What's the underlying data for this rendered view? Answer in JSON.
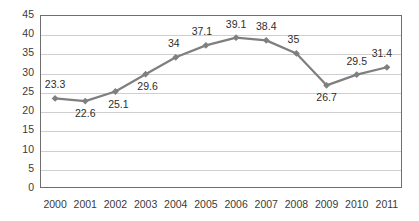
{
  "chart_data": {
    "type": "line",
    "title": "",
    "subtitle": "",
    "xlabel": "",
    "ylabel": "",
    "categories": [
      "2000",
      "2001",
      "2002",
      "2003",
      "2004",
      "2005",
      "2006",
      "2007",
      "2008",
      "2009",
      "2010",
      "2011"
    ],
    "values": [
      23.3,
      22.6,
      25.1,
      29.6,
      34,
      37.1,
      39.1,
      38.4,
      35,
      26.7,
      29.5,
      31.4
    ],
    "point_labels": [
      "23.3",
      "22.6",
      "25.1",
      "29.6",
      "34",
      "37.1",
      "39.1",
      "38.4",
      "35",
      "26.7",
      "29.5",
      "31.4"
    ],
    "label_positions": [
      "above",
      "below",
      "below",
      "below",
      "above",
      "above",
      "above",
      "above",
      "above",
      "below",
      "above",
      "above"
    ],
    "ylim": [
      0,
      45
    ],
    "ytick_step": 5,
    "yticks": [
      "0",
      "5",
      "10",
      "15",
      "20",
      "25",
      "30",
      "35",
      "40",
      "45"
    ],
    "grid": true,
    "legend": false,
    "legend_position": "none",
    "series": [
      {
        "name": "series-1",
        "color": "#7f7f7f",
        "marker": "diamond",
        "values": [
          23.3,
          22.6,
          25.1,
          29.6,
          34,
          37.1,
          39.1,
          38.4,
          35,
          26.7,
          29.5,
          31.4
        ]
      }
    ],
    "colors": {
      "line": "#7f7f7f",
      "marker": "#7f7f7f",
      "grid": "#cfcfcf",
      "axis": "#6e6e6e",
      "text": "#3a3a3a",
      "background": "#ffffff"
    }
  }
}
